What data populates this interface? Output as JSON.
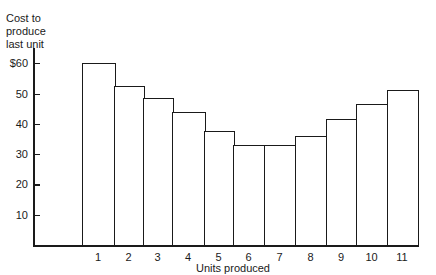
{
  "chart_data": {
    "type": "bar",
    "title": "",
    "xlabel": "Units produced",
    "ylabel": "Cost to produce last unit",
    "categories": [
      "1",
      "2",
      "3",
      "4",
      "5",
      "6",
      "7",
      "8",
      "9",
      "10",
      "11"
    ],
    "values": [
      60,
      52.5,
      48.5,
      44,
      37.5,
      33,
      33,
      36,
      41.5,
      46.5,
      51
    ],
    "yticks": [
      "10",
      "20",
      "30",
      "40",
      "50",
      "$60"
    ],
    "ytick_values": [
      10,
      20,
      30,
      40,
      50,
      60
    ],
    "ylim": [
      0,
      65
    ],
    "grid": false,
    "legend": null
  },
  "labels": {
    "ylabel_lines": [
      "Cost to",
      "produce",
      "last unit"
    ]
  }
}
